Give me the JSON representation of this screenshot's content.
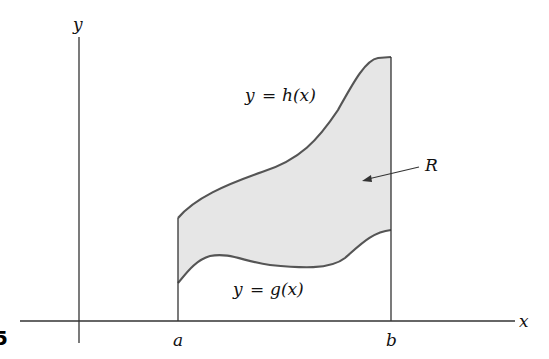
{
  "problem_number": "5",
  "axes": {
    "x_label": "x",
    "y_label": "y"
  },
  "bounds": {
    "left_label": "a",
    "right_label": "b"
  },
  "curves": {
    "upper": {
      "label_lhs": "y",
      "label_eq": "=",
      "label_rhs": "h(x)"
    },
    "lower": {
      "label_lhs": "y",
      "label_eq": "=",
      "label_rhs": "g(x)"
    }
  },
  "region": {
    "label": "R",
    "fill_color": "#e6e6e6"
  },
  "colors": {
    "curve_stroke": "#555555",
    "axis_stroke": "#333333",
    "text": "#111111"
  }
}
